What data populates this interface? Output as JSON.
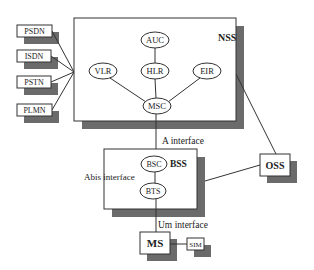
{
  "diagram": {
    "colors": {
      "shadow": "#6b6b6b",
      "stroke": "#333333",
      "fill": "#ffffff",
      "text": "#222222"
    },
    "external_networks": [
      {
        "id": "psdn",
        "label": "PSDN"
      },
      {
        "id": "isdn",
        "label": "ISDN"
      },
      {
        "id": "pstn",
        "label": "PSTN"
      },
      {
        "id": "plmn",
        "label": "PLMN"
      }
    ],
    "nss": {
      "label": "NSS",
      "nodes": [
        {
          "id": "auc",
          "label": "AUC"
        },
        {
          "id": "vlr",
          "label": "VLR"
        },
        {
          "id": "hlr",
          "label": "HLR"
        },
        {
          "id": "eir",
          "label": "EIR"
        },
        {
          "id": "msc",
          "label": "MSC"
        }
      ]
    },
    "bss": {
      "label": "BSS",
      "nodes": [
        {
          "id": "bsc",
          "label": "BSC"
        },
        {
          "id": "bts",
          "label": "BTS"
        }
      ]
    },
    "oss": {
      "label": "OSS"
    },
    "ms": {
      "label": "MS"
    },
    "sim": {
      "label": "SIM"
    },
    "interfaces": {
      "a": "A interface",
      "abis": "Abis interface",
      "um": "Um interface"
    },
    "edges": [
      [
        "PSDN",
        "NSS"
      ],
      [
        "ISDN",
        "NSS"
      ],
      [
        "PSTN",
        "NSS"
      ],
      [
        "PLMN",
        "NSS"
      ],
      [
        "AUC",
        "HLR"
      ],
      [
        "HLR",
        "MSC"
      ],
      [
        "VLR",
        "MSC"
      ],
      [
        "EIR",
        "MSC"
      ],
      [
        "MSC",
        "BSC"
      ],
      [
        "BSC",
        "BTS"
      ],
      [
        "BTS",
        "MS"
      ],
      [
        "MS",
        "SIM"
      ],
      [
        "NSS",
        "OSS"
      ],
      [
        "BSS",
        "OSS"
      ]
    ]
  }
}
